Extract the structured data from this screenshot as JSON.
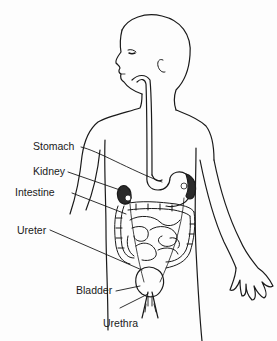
{
  "diagram": {
    "labels": [
      {
        "id": "stomach",
        "text": "Stomach"
      },
      {
        "id": "kidney",
        "text": "Kidney"
      },
      {
        "id": "intestine",
        "text": "Intestine"
      },
      {
        "id": "ureter",
        "text": "Ureter"
      },
      {
        "id": "bladder",
        "text": "Bladder"
      },
      {
        "id": "urethra",
        "text": "Urethra"
      }
    ],
    "colors": {
      "line": "#1a1a1a",
      "organ_dark": "#2a2a2a",
      "background": "#fdfdfd"
    }
  }
}
